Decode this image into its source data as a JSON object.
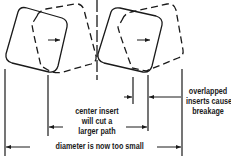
{
  "diagram": {
    "title": "",
    "colors": {
      "line": "#1a1a1a",
      "background": "#ffffff"
    },
    "inserts": [
      {
        "id": "left-insert-solid",
        "style": "solid"
      },
      {
        "id": "left-insert-dashed",
        "style": "dashed"
      },
      {
        "id": "center-insert-solid",
        "style": "solid"
      },
      {
        "id": "center-insert-dashed",
        "style": "dashed"
      }
    ],
    "labels": {
      "center_insert": [
        "center insert",
        "will cut a",
        "larger path"
      ],
      "overlapped": [
        "overlapped",
        "inserts cause",
        "breakage"
      ],
      "diameter": "diameter is now too small"
    }
  }
}
